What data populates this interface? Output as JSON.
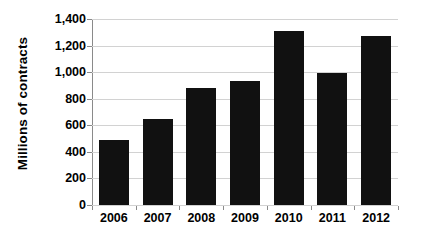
{
  "chart_data": {
    "type": "bar",
    "title": "",
    "xlabel": "",
    "ylabel": "Millions of contracts",
    "categories": [
      "2006",
      "2007",
      "2008",
      "2009",
      "2010",
      "2011",
      "2012"
    ],
    "values": [
      490,
      645,
      880,
      930,
      1310,
      995,
      1270
    ],
    "ylim": [
      0,
      1400
    ],
    "yticks": [
      0,
      200,
      400,
      600,
      800,
      1000,
      1200,
      1400
    ],
    "ytick_labels": [
      "0",
      "200",
      "400",
      "600",
      "800",
      "1,000",
      "1,200",
      "1,400"
    ],
    "grid": true,
    "legend": false,
    "series": [
      {
        "name": "Millions of contracts",
        "values": [
          490,
          645,
          880,
          930,
          1310,
          995,
          1270
        ],
        "color": "#111111"
      }
    ],
    "colors": {
      "bar": "#111111",
      "grid": "#d2d2d2",
      "axis": "#8a8a8a",
      "text": "#000000",
      "background": "#ffffff"
    }
  }
}
